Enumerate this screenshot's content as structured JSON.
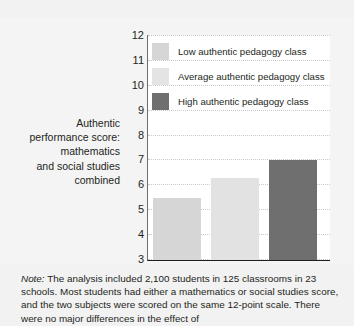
{
  "chart_data": {
    "type": "bar",
    "title": "",
    "subtitle": "",
    "xlabel": "",
    "ylabel": "Authentic performance score: mathematics and social studies combined",
    "ylabel_lines": [
      "Authentic",
      "performance score:",
      "mathematics",
      "and social studies",
      "combined"
    ],
    "ylim": [
      3,
      12
    ],
    "yticks": [
      3,
      4,
      5,
      6,
      7,
      8,
      9,
      10,
      11,
      12
    ],
    "ytick_labels": [
      "3",
      "4",
      "5",
      "6",
      "7",
      "8",
      "9",
      "10",
      "11",
      "12"
    ],
    "grid": true,
    "grid_style": "dotted-horizontal",
    "legend_position": "inside-top-left",
    "categories": [
      "Low authentic pedagogy class",
      "Average authentic pedagogy class",
      "High authentic pedagogy class"
    ],
    "values": [
      5.5,
      6.3,
      7.0
    ],
    "bar_colors": [
      "#d6d6d6",
      "#e2e2e2",
      "#6f6f6f"
    ],
    "series": [
      {
        "name": "Authentic performance score",
        "values": [
          5.5,
          6.3,
          7.0
        ]
      }
    ]
  },
  "legend": {
    "items": [
      {
        "label": "Low authentic pedagogy class",
        "color": "#d6d6d6"
      },
      {
        "label": "Average authentic pedagogy class",
        "color": "#e4e4e4"
      },
      {
        "label": "High authentic pedagogy class",
        "color": "#6f6f6f"
      }
    ]
  },
  "caption": {
    "note_word": "Note:",
    "text": " The analysis included 2,100 students in 125 classrooms in 23 schools. Most students had either a mathematics or social studies score, and the two subjects were scored on the same 12-point scale. There were no major differences in the effect of"
  }
}
